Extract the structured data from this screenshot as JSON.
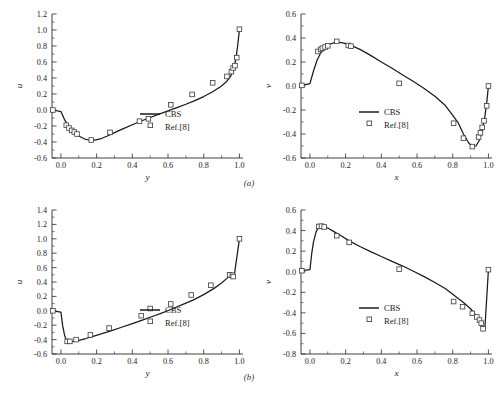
{
  "figure": {
    "subcaption_a": "(a)",
    "subcaption_b": "(b)"
  },
  "legend": {
    "series_line_label": "CBS",
    "series_marker_label": "Ref.[8]"
  },
  "chart_data": [
    {
      "id": "top-left",
      "type": "line",
      "title": "",
      "xlabel": "y",
      "ylabel": "u",
      "xlim": [
        -0.05,
        1.02
      ],
      "ylim": [
        -0.6,
        1.2
      ],
      "xticks": [
        0.0,
        0.2,
        0.4,
        0.6,
        0.8,
        1.0
      ],
      "xticklabels": [
        "0.0",
        "0.2",
        "0.4",
        "0.6",
        "0.8",
        "1.0"
      ],
      "yticks": [
        -0.6,
        -0.4,
        -0.2,
        0.0,
        0.2,
        0.4,
        0.6,
        0.8,
        1.0,
        1.2
      ],
      "yticklabels": [
        "-0.6",
        "-0.4",
        "-0.2",
        "0.0",
        "0.2",
        "0.4",
        "0.6",
        "0.8",
        "1.0",
        "1.2"
      ],
      "grid": false,
      "legend_position": "lower-right",
      "series": [
        {
          "name": "CBS",
          "style": "line",
          "x": [
            -0.045,
            0.0,
            0.02,
            0.04,
            0.06,
            0.08,
            0.1,
            0.13,
            0.16,
            0.19,
            0.22,
            0.26,
            0.3,
            0.35,
            0.4,
            0.45,
            0.5,
            0.55,
            0.6,
            0.65,
            0.7,
            0.75,
            0.8,
            0.85,
            0.9,
            0.93,
            0.95,
            0.96,
            0.97,
            0.98,
            0.99,
            1.0
          ],
          "y": [
            0.0,
            -0.02,
            -0.12,
            -0.19,
            -0.245,
            -0.29,
            -0.325,
            -0.36,
            -0.378,
            -0.377,
            -0.362,
            -0.325,
            -0.283,
            -0.233,
            -0.185,
            -0.138,
            -0.094,
            -0.052,
            -0.012,
            0.03,
            0.072,
            0.118,
            0.168,
            0.228,
            0.3,
            0.36,
            0.42,
            0.47,
            0.535,
            0.635,
            0.8,
            1.005
          ]
        },
        {
          "name": "Ref.[8]",
          "style": "markers",
          "x": [
            -0.045,
            0.03,
            0.045,
            0.06,
            0.075,
            0.09,
            0.17,
            0.275,
            0.44,
            0.49,
            0.615,
            0.735,
            0.85,
            0.93,
            0.955,
            0.965,
            0.975,
            0.985,
            1.0
          ],
          "y": [
            0.0,
            -0.19,
            -0.225,
            -0.255,
            -0.275,
            -0.3,
            -0.375,
            -0.28,
            -0.14,
            -0.11,
            0.065,
            0.195,
            0.34,
            0.42,
            0.48,
            0.525,
            0.555,
            0.655,
            1.01
          ]
        }
      ]
    },
    {
      "id": "top-right",
      "type": "line",
      "title": "",
      "xlabel": "x",
      "ylabel": "v",
      "xlim": [
        -0.05,
        1.02
      ],
      "ylim": [
        -0.6,
        0.6
      ],
      "xticks": [
        0.0,
        0.2,
        0.4,
        0.6,
        0.8,
        1.0
      ],
      "xticklabels": [
        "0.0",
        "0.2",
        "0.4",
        "0.6",
        "0.8",
        "1.0"
      ],
      "yticks": [
        -0.6,
        -0.4,
        -0.2,
        0.0,
        0.2,
        0.4,
        0.6
      ],
      "yticklabels": [
        "-0.6",
        "-0.4",
        "-0.2",
        "0.0",
        "0.2",
        "0.4",
        "0.6"
      ],
      "grid": false,
      "legend_position": "lower-center",
      "series": [
        {
          "name": "CBS",
          "style": "line",
          "x": [
            -0.045,
            0.0,
            0.02,
            0.04,
            0.06,
            0.08,
            0.11,
            0.15,
            0.19,
            0.23,
            0.28,
            0.34,
            0.4,
            0.46,
            0.52,
            0.58,
            0.64,
            0.7,
            0.76,
            0.8,
            0.83,
            0.86,
            0.89,
            0.91,
            0.93,
            0.95,
            0.96,
            0.97,
            0.98,
            0.99,
            1.0
          ],
          "y": [
            0.005,
            0.02,
            0.125,
            0.215,
            0.275,
            0.312,
            0.348,
            0.368,
            0.358,
            0.338,
            0.305,
            0.255,
            0.2,
            0.148,
            0.092,
            0.038,
            -0.02,
            -0.085,
            -0.165,
            -0.245,
            -0.305,
            -0.4,
            -0.475,
            -0.505,
            -0.5,
            -0.45,
            -0.4,
            -0.335,
            -0.255,
            -0.145,
            0.0
          ]
        },
        {
          "name": "Ref.[8]",
          "style": "markers",
          "x": [
            -0.045,
            0.045,
            0.06,
            0.07,
            0.085,
            0.1,
            0.15,
            0.215,
            0.23,
            0.5,
            0.805,
            0.86,
            0.91,
            0.945,
            0.955,
            0.965,
            0.975,
            0.99,
            1.0
          ],
          "y": [
            0.005,
            0.288,
            0.305,
            0.315,
            0.325,
            0.335,
            0.372,
            0.338,
            0.332,
            0.022,
            -0.31,
            -0.435,
            -0.505,
            -0.425,
            -0.39,
            -0.345,
            -0.29,
            -0.165,
            0.0
          ]
        }
      ]
    },
    {
      "id": "bottom-left",
      "type": "line",
      "title": "",
      "xlabel": "y",
      "ylabel": "u",
      "xlim": [
        -0.05,
        1.02
      ],
      "ylim": [
        -0.6,
        1.4
      ],
      "xticks": [
        0.0,
        0.2,
        0.4,
        0.6,
        0.8,
        1.0
      ],
      "xticklabels": [
        "0.0",
        "0.2",
        "0.4",
        "0.6",
        "0.8",
        "1.0"
      ],
      "yticks": [
        -0.6,
        -0.4,
        -0.2,
        0.0,
        0.2,
        0.4,
        0.6,
        0.8,
        1.0,
        1.2,
        1.4
      ],
      "yticklabels": [
        "-0.6",
        "-0.4",
        "-0.2",
        "0.0",
        "0.2",
        "0.4",
        "0.6",
        "0.8",
        "1.0",
        "1.2",
        "1.4"
      ],
      "grid": false,
      "legend_position": "lower-right",
      "series": [
        {
          "name": "CBS",
          "style": "line",
          "x": [
            -0.045,
            0.0,
            0.01,
            0.02,
            0.03,
            0.05,
            0.07,
            0.1,
            0.14,
            0.18,
            0.23,
            0.28,
            0.34,
            0.4,
            0.46,
            0.5,
            0.56,
            0.62,
            0.68,
            0.74,
            0.8,
            0.86,
            0.9,
            0.93,
            0.95,
            0.96,
            0.965,
            0.97,
            1.0
          ],
          "y": [
            0.0,
            -0.02,
            -0.21,
            -0.335,
            -0.405,
            -0.428,
            -0.425,
            -0.41,
            -0.385,
            -0.355,
            -0.318,
            -0.278,
            -0.228,
            -0.178,
            -0.125,
            -0.09,
            -0.035,
            0.022,
            0.085,
            0.148,
            0.225,
            0.315,
            0.385,
            0.45,
            0.5,
            0.5,
            0.47,
            0.47,
            1.0
          ]
        },
        {
          "name": "Ref.[8]",
          "style": "markers",
          "x": [
            -0.045,
            0.035,
            0.05,
            0.085,
            0.165,
            0.27,
            0.45,
            0.5,
            0.615,
            0.73,
            0.84,
            0.945,
            0.96,
            0.965,
            1.0
          ],
          "y": [
            0.0,
            -0.425,
            -0.425,
            -0.4,
            -0.335,
            -0.24,
            -0.068,
            0.032,
            0.095,
            0.22,
            0.355,
            0.5,
            0.495,
            0.475,
            1.0
          ]
        }
      ]
    },
    {
      "id": "bottom-right",
      "type": "line",
      "title": "",
      "xlabel": "x",
      "ylabel": "v",
      "xlim": [
        -0.05,
        1.02
      ],
      "ylim": [
        -0.8,
        0.6
      ],
      "xticks": [
        0.0,
        0.2,
        0.4,
        0.6,
        0.8,
        1.0
      ],
      "xticklabels": [
        "0.0",
        "0.2",
        "0.4",
        "0.6",
        "0.8",
        "1.0"
      ],
      "yticks": [
        -0.8,
        -0.6,
        -0.4,
        -0.2,
        0.0,
        0.2,
        0.4,
        0.6
      ],
      "yticklabels": [
        "-0.8",
        "-0.6",
        "-0.4",
        "-0.2",
        "0.0",
        "0.2",
        "0.4",
        "0.6"
      ],
      "grid": false,
      "legend_position": "lower-center",
      "series": [
        {
          "name": "CBS",
          "style": "line",
          "x": [
            -0.045,
            0.0,
            0.01,
            0.02,
            0.035,
            0.05,
            0.065,
            0.08,
            0.1,
            0.13,
            0.17,
            0.22,
            0.28,
            0.34,
            0.4,
            0.46,
            0.52,
            0.58,
            0.64,
            0.7,
            0.76,
            0.82,
            0.86,
            0.9,
            0.93,
            0.95,
            0.96,
            0.97,
            0.98,
            1.0
          ],
          "y": [
            0.01,
            0.02,
            0.175,
            0.29,
            0.39,
            0.435,
            0.443,
            0.438,
            0.425,
            0.395,
            0.355,
            0.3,
            0.245,
            0.195,
            0.148,
            0.1,
            0.055,
            0.005,
            -0.048,
            -0.105,
            -0.165,
            -0.245,
            -0.3,
            -0.36,
            -0.425,
            -0.49,
            -0.525,
            -0.555,
            -0.555,
            0.02
          ]
        },
        {
          "name": "Ref.[8]",
          "style": "markers",
          "x": [
            -0.045,
            0.05,
            0.065,
            0.08,
            0.15,
            0.22,
            0.5,
            0.805,
            0.855,
            0.91,
            0.935,
            0.95,
            0.96,
            0.97,
            1.0
          ],
          "y": [
            0.01,
            0.44,
            0.443,
            0.435,
            0.35,
            0.285,
            0.025,
            -0.29,
            -0.34,
            -0.405,
            -0.44,
            -0.47,
            -0.5,
            -0.555,
            0.02
          ]
        }
      ]
    }
  ]
}
